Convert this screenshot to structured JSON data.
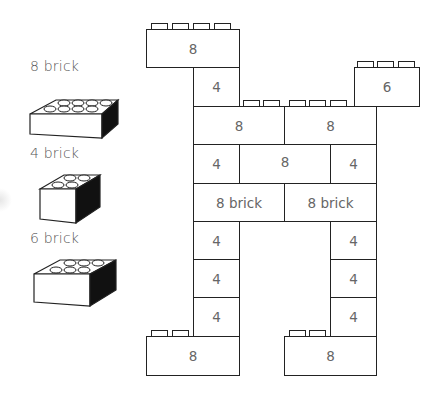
{
  "legend": {
    "items": [
      {
        "label": "8 brick",
        "studs": 8
      },
      {
        "label": "4 brick",
        "studs": 4
      },
      {
        "label": "6 brick",
        "studs": 6
      }
    ]
  },
  "structure": {
    "bricks": [
      {
        "id": "top-left",
        "label": "8"
      },
      {
        "id": "left-upper-4",
        "label": "4"
      },
      {
        "id": "top-right",
        "label": "6"
      },
      {
        "id": "row3-left",
        "label": "8"
      },
      {
        "id": "row3-right",
        "label": "8"
      },
      {
        "id": "row4-left",
        "label": "4"
      },
      {
        "id": "row4-mid",
        "label": "8"
      },
      {
        "id": "row4-right",
        "label": "4"
      },
      {
        "id": "row5-left",
        "label": "8 brick"
      },
      {
        "id": "row5-right",
        "label": "8 brick"
      },
      {
        "id": "leg-left-1",
        "label": "4"
      },
      {
        "id": "leg-right-1",
        "label": "4"
      },
      {
        "id": "leg-left-2",
        "label": "4"
      },
      {
        "id": "leg-right-2",
        "label": "4"
      },
      {
        "id": "leg-left-3",
        "label": "4"
      },
      {
        "id": "leg-right-3",
        "label": "4"
      },
      {
        "id": "foot-left",
        "label": "8"
      },
      {
        "id": "foot-right",
        "label": "8"
      }
    ]
  },
  "colors": {
    "stroke": "#222222",
    "text": "#555555",
    "fill": "#ffffff",
    "shadow": "#000000"
  }
}
